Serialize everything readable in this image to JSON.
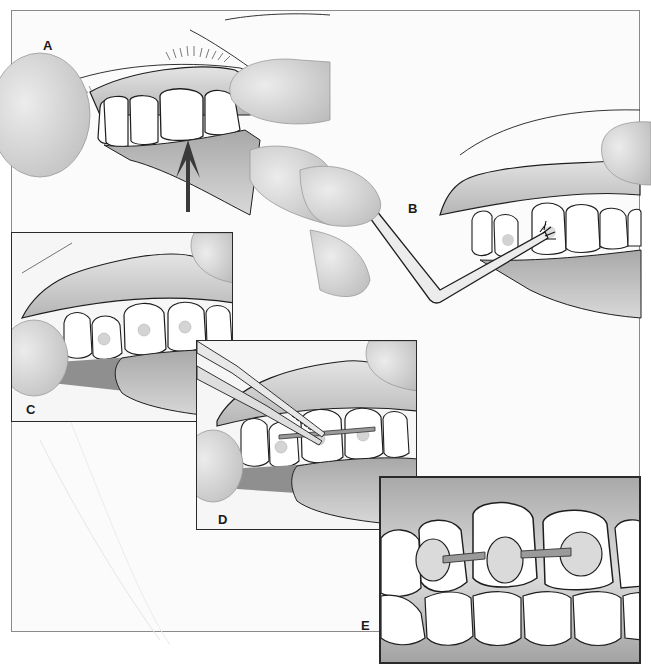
{
  "figure": {
    "panels": [
      {
        "id": "A",
        "label": "A",
        "caption_hint": "fingers retract lip; arrow points to incisor"
      },
      {
        "id": "B",
        "label": "B",
        "caption_hint": "brush applicator on tooth surface"
      },
      {
        "id": "C",
        "label": "C",
        "caption_hint": "resin dots placed on teeth"
      },
      {
        "id": "D",
        "label": "D",
        "caption_hint": "tweezers placing wire across teeth"
      },
      {
        "id": "E",
        "label": "E",
        "caption_hint": "close-up of wire bonded across three teeth"
      }
    ]
  },
  "colors": {
    "line": "#1e1e1e",
    "tooth": "#ffffff",
    "gum": "#c9c9c9",
    "gum_dark": "#8f8f8f",
    "skin": "#d8d8d8",
    "frame": "#8a8a8a",
    "panel_border": "#2a2a2a",
    "arrow": "#3a3a3a",
    "resin_dot": "#d2d2d2",
    "wire": "#9a9a9a"
  }
}
